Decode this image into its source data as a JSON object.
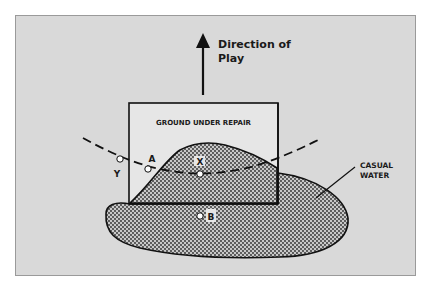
{
  "diagram": {
    "direction_label_line1": "Direction of",
    "direction_label_line2": "Play",
    "gur_label": "GROUND UNDER REPAIR",
    "casual_water_line1": "CASUAL",
    "casual_water_line2": "WATER",
    "points": {
      "a": "A",
      "x": "X",
      "y": "Y",
      "b": "B"
    },
    "colors": {
      "frame_fill": "#d9d9d9",
      "frame_border": "#9a9a9a",
      "gur_fill": "#e6e6e6",
      "line": "#111111",
      "stipple_dot": "#2a2a2a",
      "stipple_bg": "#c8c8c8"
    }
  }
}
